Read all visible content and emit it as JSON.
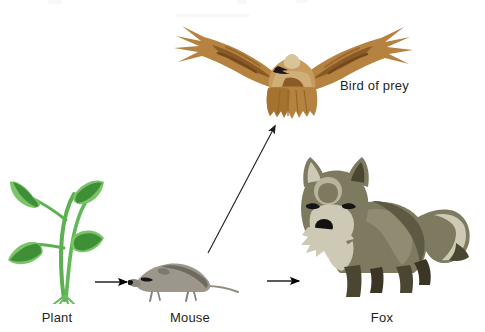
{
  "diagram": {
    "background_color": "#ffffff",
    "organisms": [
      {
        "id": "plant",
        "label": "Plant",
        "icon": "plant-illustration",
        "trophic_level": "producer",
        "colors": {
          "leaf_light": "#7cc46a",
          "leaf_dark": "#3f8f37",
          "stem": "#5cb052"
        }
      },
      {
        "id": "mouse",
        "label": "Mouse",
        "icon": "mouse-illustration",
        "trophic_level": "primary consumer",
        "colors": {
          "body": "#9c968c",
          "back": "#6f6a5e",
          "dark": "#1a1a1a"
        }
      },
      {
        "id": "fox",
        "label": "Fox",
        "icon": "fox-illustration",
        "trophic_level": "secondary consumer",
        "colors": {
          "body": "#7d7a60",
          "light": "#cdc9b4",
          "dark": "#4b4632",
          "darkest": "#3a3524"
        }
      },
      {
        "id": "bird-of-prey",
        "label": "Bird of prey",
        "icon": "bird-of-prey-illustration",
        "trophic_level": "secondary consumer",
        "colors": {
          "wing": "#b5823f",
          "wing_dark": "#8a5a27",
          "body_light": "#d8c39a",
          "dark": "#1a1a1a"
        }
      }
    ],
    "arrows": [
      {
        "id": "plant-to-mouse",
        "from": "Plant",
        "to": "Mouse",
        "style": "straight-horizontal",
        "color": "#000000"
      },
      {
        "id": "mouse-to-fox",
        "from": "Mouse",
        "to": "Fox",
        "style": "straight-horizontal",
        "color": "#000000"
      },
      {
        "id": "mouse-to-bird",
        "from": "Mouse",
        "to": "Bird of prey",
        "style": "straight-diagonal",
        "color": "#1c1c1c"
      }
    ]
  }
}
